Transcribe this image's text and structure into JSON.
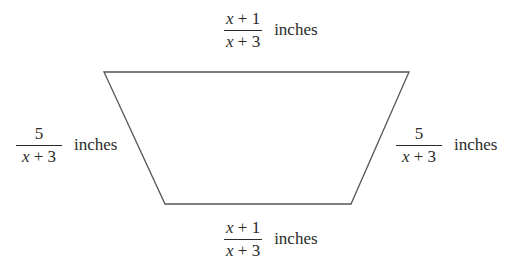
{
  "figure": {
    "type": "trapezoid",
    "stroke_color": "#555555",
    "vertices": {
      "top_left": [
        104,
        72
      ],
      "top_right": [
        409,
        72
      ],
      "bottom_right": [
        351,
        204
      ],
      "bottom_left": [
        165,
        204
      ]
    }
  },
  "labels": {
    "top": {
      "numerator": "x + 1",
      "denominator": "x + 3",
      "unit": "inches"
    },
    "left": {
      "numerator": "5",
      "denominator": "x + 3",
      "unit": "inches"
    },
    "right": {
      "numerator": "5",
      "denominator": "x + 3",
      "unit": "inches"
    },
    "bottom": {
      "numerator": "x + 1",
      "denominator": "x + 3",
      "unit": "inches"
    }
  }
}
